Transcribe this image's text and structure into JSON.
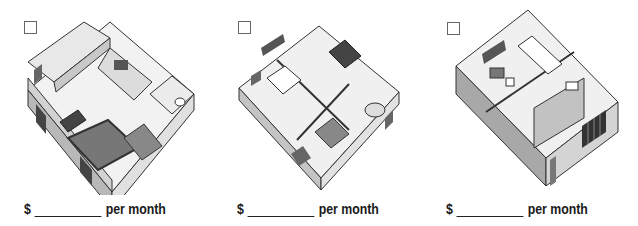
{
  "apartments": [
    {
      "id": "studio",
      "checked": false,
      "currency": "$",
      "rent_value": "",
      "per_label": "per month",
      "plan_icon": "studio-floorplan-icon"
    },
    {
      "id": "two-bedroom",
      "checked": false,
      "currency": "$",
      "rent_value": "",
      "per_label": "per month",
      "plan_icon": "two-bedroom-floorplan-icon"
    },
    {
      "id": "one-bedroom",
      "checked": false,
      "currency": "$",
      "rent_value": "",
      "per_label": "per month",
      "plan_icon": "one-bedroom-floorplan-icon"
    }
  ],
  "colors": {
    "wall_light": "#e6e6e6",
    "wall_mid": "#b8b8b8",
    "wall_dark": "#8a8a8a",
    "floor": "#f2f2f2",
    "outline": "#333333",
    "furniture": "#555555"
  }
}
